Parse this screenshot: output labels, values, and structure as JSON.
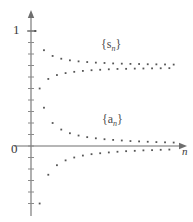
{
  "chart_data": {
    "type": "scatter",
    "title": "",
    "xlabel": "n",
    "ylabel": "",
    "grid": false,
    "legend_position": "inline-annotation",
    "axis": {
      "x_axis_label": "n",
      "y_tick_labels": [
        "1",
        "0"
      ],
      "y_tick_values": [
        1,
        0
      ],
      "x_origin_label": "0",
      "x_arrow": true,
      "y_arrow": true,
      "xlim": [
        0,
        34
      ],
      "ylim": [
        -1.05,
        1.15
      ]
    },
    "annotations": [
      {
        "text": "{s_n}",
        "display": "{s",
        "sub": "n",
        "close": "}",
        "x": 15,
        "y": 0.82
      },
      {
        "text": "{a_n}",
        "display": "{a",
        "sub": "n",
        "close": "}",
        "x": 15,
        "y": 0.22
      }
    ],
    "series": [
      {
        "name": "{s_n}",
        "label": "partial-sums",
        "color": "#555555",
        "marker": "square",
        "x": [
          1,
          2,
          3,
          4,
          5,
          6,
          7,
          8,
          9,
          10,
          11,
          12,
          13,
          14,
          15,
          16,
          17,
          18,
          19,
          20,
          21,
          22,
          23,
          24,
          25,
          26,
          27,
          28,
          29,
          30,
          31,
          32,
          33
        ],
        "values": [
          1.0,
          0.5,
          0.833,
          0.583,
          0.783,
          0.617,
          0.759,
          0.634,
          0.745,
          0.645,
          0.736,
          0.653,
          0.73,
          0.659,
          0.725,
          0.663,
          0.722,
          0.667,
          0.718,
          0.67,
          0.716,
          0.671,
          0.714,
          0.673,
          0.713,
          0.674,
          0.711,
          0.675,
          0.71,
          0.676,
          0.709,
          0.677,
          0.708
        ]
      },
      {
        "name": "{a_n}",
        "label": "terms",
        "color": "#555555",
        "marker": "square",
        "x": [
          1,
          2,
          3,
          4,
          5,
          6,
          7,
          8,
          9,
          10,
          11,
          12,
          13,
          14,
          15,
          16,
          17,
          18,
          19,
          20,
          21,
          22,
          23,
          24,
          25,
          26,
          27,
          28,
          29,
          30,
          31,
          32,
          33
        ],
        "values": [
          1.0,
          -0.5,
          0.333,
          -0.25,
          0.2,
          -0.167,
          0.143,
          -0.125,
          0.111,
          -0.1,
          0.091,
          -0.083,
          0.077,
          -0.071,
          0.067,
          -0.063,
          0.059,
          -0.056,
          0.053,
          -0.05,
          0.048,
          -0.045,
          0.043,
          -0.042,
          0.04,
          -0.038,
          0.037,
          -0.036,
          0.034,
          -0.033,
          0.032,
          -0.031,
          0.03
        ]
      }
    ],
    "style": {
      "axis_color": "#6e6e6e",
      "dot_color": "#5a5a5a",
      "tick_color": "#8a8a8a",
      "background": "#ffffff"
    }
  }
}
